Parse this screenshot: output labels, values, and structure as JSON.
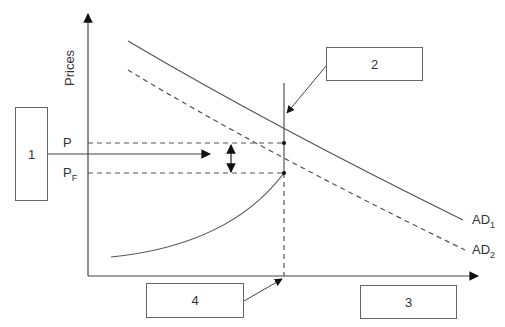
{
  "diagram": {
    "axis": {
      "y_label": "Prices"
    },
    "price_labels": {
      "p": "P",
      "pf_main": "P",
      "pf_sub": "F"
    },
    "curves": {
      "ad1_main": "AD",
      "ad1_sub": "1",
      "ad2_main": "AD",
      "ad2_sub": "2"
    },
    "boxes": [
      {
        "id": "1",
        "label": "1"
      },
      {
        "id": "2",
        "label": "2"
      },
      {
        "id": "3",
        "label": "3"
      },
      {
        "id": "4",
        "label": "4"
      }
    ],
    "colors": {
      "line": "#555555",
      "box_border": "#666666",
      "background": "#ffffff"
    }
  }
}
